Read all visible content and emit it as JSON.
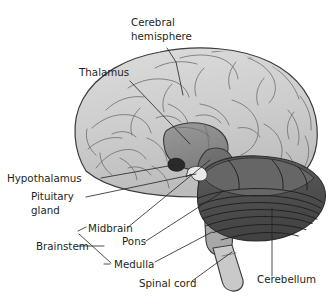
{
  "figure": {
    "style": "grayscale medical illustration",
    "background_color": "#ffffff",
    "width": 333,
    "height": 304
  },
  "palette": {
    "cerebrum_fill": "#cfcfcf",
    "cerebrum_shade": "#bdbdbd",
    "thalamus_fill": "#8d8d8d",
    "midbrain_pons_fill": "#6b6b6b",
    "cerebellum_fill": "#4d4d4d",
    "cerebellum_upper_fill": "#5c5c5c",
    "spinal_cord_fill": "#c9c9c9",
    "hypothalamus_fill": "#2a2a2a",
    "pituitary_fill": "#e8e8e8",
    "outline": "#3b3b3b",
    "label_color": "#231f20",
    "leader_color": "#231f20"
  },
  "labels": [
    {
      "id": "cerebral-hemisphere",
      "lines": [
        "Cerebral",
        "hemisphere"
      ],
      "text": "Cerebral hemisphere",
      "x": 131,
      "y": 26,
      "anchor": "start",
      "line_count": 2
    },
    {
      "id": "thalamus",
      "lines": [
        "Thalamus"
      ],
      "text": "Thalamus",
      "x": 79,
      "y": 76,
      "anchor": "start",
      "line_count": 1
    },
    {
      "id": "hypothalamus",
      "lines": [
        "Hypothalamus"
      ],
      "text": "Hypothalamus",
      "x": 7,
      "y": 182,
      "anchor": "start",
      "line_count": 1
    },
    {
      "id": "pituitary-gland",
      "lines": [
        "Pituitary",
        "gland"
      ],
      "text": "Pituitary gland",
      "x": 31,
      "y": 200,
      "anchor": "start",
      "line_count": 2
    },
    {
      "id": "midbrain",
      "lines": [
        "Midbrain"
      ],
      "text": "Midbrain",
      "x": 82,
      "y": 232,
      "anchor": "start",
      "line_count": 1
    },
    {
      "id": "brainstem",
      "lines": [
        "Brainstem"
      ],
      "text": "Brainstem",
      "x": 36,
      "y": 249,
      "anchor": "start",
      "line_count": 1
    },
    {
      "id": "pons",
      "lines": [
        "Pons"
      ],
      "text": "Pons",
      "x": 122,
      "y": 244,
      "anchor": "start",
      "line_count": 1
    },
    {
      "id": "medulla",
      "lines": [
        "Medulla"
      ],
      "text": "Medulla",
      "x": 112,
      "y": 265,
      "anchor": "start",
      "line_count": 1
    },
    {
      "id": "spinal-cord",
      "lines": [
        "Spinal cord"
      ],
      "text": "Spinal cord",
      "x": 139,
      "y": 285,
      "anchor": "start",
      "line_count": 1
    },
    {
      "id": "cerebellum",
      "lines": [
        "Cerebellum"
      ],
      "text": "Cerebellum",
      "x": 257,
      "y": 283,
      "anchor": "start",
      "line_count": 1
    }
  ],
  "structures": [
    {
      "id": "cerebral-hemisphere",
      "name": "Cerebral hemisphere",
      "tone": "light gray, covered with thin sulci lines"
    },
    {
      "id": "thalamus",
      "name": "Thalamus",
      "tone": "medium gray oval at center"
    },
    {
      "id": "hypothalamus",
      "name": "Hypothalamus",
      "tone": "small dark patch below thalamus"
    },
    {
      "id": "pituitary-gland",
      "name": "Pituitary gland",
      "tone": "small pale hook below hypothalamus"
    },
    {
      "id": "midbrain",
      "name": "Midbrain",
      "tone": "dark gray upper brainstem"
    },
    {
      "id": "pons",
      "name": "Pons",
      "tone": "dark gray bulge of brainstem"
    },
    {
      "id": "medulla",
      "name": "Medulla",
      "tone": "gray lower brainstem tapering down"
    },
    {
      "id": "spinal-cord",
      "name": "Spinal cord",
      "tone": "pale gray column exiting at bottom"
    },
    {
      "id": "cerebellum",
      "name": "Cerebellum",
      "tone": "darkest gray mass with horizontal folia striations"
    },
    {
      "id": "brainstem",
      "name": "Brainstem",
      "tone": "bracket grouping midbrain, pons and medulla"
    }
  ]
}
